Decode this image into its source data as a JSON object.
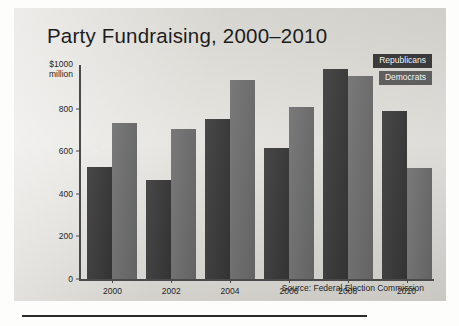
{
  "chart_data": {
    "type": "bar",
    "title": "Party Fundraising, 2000–2010",
    "xlabel": "",
    "ylabel": "$1000 million",
    "ylim": [
      0,
      1000
    ],
    "yticks": [
      0,
      200,
      400,
      600,
      800
    ],
    "ytick_labels": [
      "0",
      "200",
      "400",
      "600",
      "800"
    ],
    "y_top_label": "$1000\nmillion",
    "y_top_label_line1": "$1000",
    "y_top_label_line2": "million",
    "grid": false,
    "legend_position": "top-right",
    "categories": [
      "2000",
      "2002",
      "2004",
      "2006",
      "2008",
      "2010"
    ],
    "series": [
      {
        "name": "Republicans",
        "color": "#3a3a3a",
        "values": [
          527,
          466,
          753,
          616,
          984,
          791
        ]
      },
      {
        "name": "Democrats",
        "color": "#6e6e6e",
        "values": [
          734,
          706,
          932,
          809,
          955,
          522
        ]
      }
    ],
    "source_note": "Source: Federal Election Commission",
    "units": "millions of dollars"
  },
  "legend": {
    "items": [
      {
        "label": "Republicans",
        "key": "rep"
      },
      {
        "label": "Democrats",
        "key": "dem"
      }
    ]
  }
}
